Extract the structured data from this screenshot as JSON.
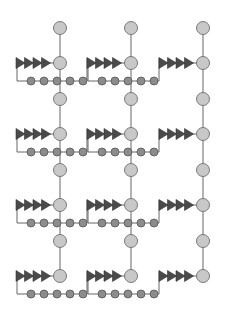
{
  "diagram": {
    "type": "lattice-network",
    "colors": {
      "background": "#ffffff",
      "large_node_fill": "#c8c8c8",
      "large_node_stroke": "#6e6e6e",
      "small_node_fill": "#8c8c8c",
      "small_node_stroke": "#555555",
      "triangle_fill": "#4a4a4a",
      "edge": "#666666"
    },
    "columns_x": [
      60,
      131,
      203
    ],
    "top_node_y": 28,
    "main_rows_y": [
      63,
      134,
      205,
      276
    ],
    "intermediate_rows_y": [
      99,
      170,
      241
    ],
    "large_radius": 6.5,
    "small_radius": 4,
    "triangle_count": 4,
    "small_node_count": 5,
    "units": [
      {
        "col": 0,
        "row": 0,
        "has_branch": true
      },
      {
        "col": 1,
        "row": 0,
        "has_branch": true
      },
      {
        "col": 2,
        "row": 0,
        "has_branch": false
      },
      {
        "col": 0,
        "row": 1,
        "has_branch": true
      },
      {
        "col": 1,
        "row": 1,
        "has_branch": true
      },
      {
        "col": 2,
        "row": 1,
        "has_branch": false
      },
      {
        "col": 0,
        "row": 2,
        "has_branch": true
      },
      {
        "col": 1,
        "row": 2,
        "has_branch": true
      },
      {
        "col": 2,
        "row": 2,
        "has_branch": false
      },
      {
        "col": 0,
        "row": 3,
        "has_branch": true
      },
      {
        "col": 1,
        "row": 3,
        "has_branch": true
      },
      {
        "col": 2,
        "row": 3,
        "has_branch": false
      }
    ]
  }
}
